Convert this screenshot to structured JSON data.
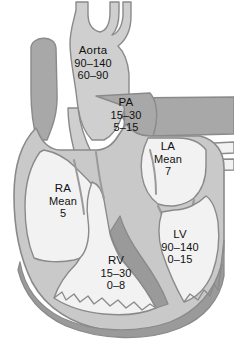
{
  "figure": {
    "units": "mmHg",
    "width": 234,
    "height": 346
  },
  "colors": {
    "background": "#ffffff",
    "chamber_lumen": "#f2f2f2",
    "myocardium": "#c9c9c9",
    "vessel_dark": "#a8a8a8",
    "apex_band": "#9a9a9a",
    "outline": "#8a8a8a",
    "text": "#111111"
  },
  "labels": {
    "aorta": {
      "name": "Aorta",
      "systolic": "90–140",
      "diastolic": "60–90"
    },
    "pa": {
      "name": "PA",
      "systolic": "15–30",
      "diastolic": "5–15"
    },
    "la": {
      "name": "LA",
      "measure": "Mean",
      "value": "7"
    },
    "ra": {
      "name": "RA",
      "measure": "Mean",
      "value": "5"
    },
    "lv": {
      "name": "LV",
      "systolic": "90–140",
      "diastolic": "0–15"
    },
    "rv": {
      "name": "RV",
      "systolic": "15–30",
      "diastolic": "0–8"
    }
  },
  "structures": [
    {
      "id": "svc",
      "label": "superior vena cava"
    },
    {
      "id": "aortic-arch",
      "label": "aortic arch with brachiocephalic branches"
    },
    {
      "id": "main-pulmonary-artery",
      "label": "main pulmonary artery"
    },
    {
      "id": "right-pulmonary-artery",
      "label": "right pulmonary artery"
    },
    {
      "id": "pulmonary-veins",
      "label": "pulmonary veins"
    },
    {
      "id": "right-atrium",
      "label": "right atrium"
    },
    {
      "id": "left-atrium",
      "label": "left atrium"
    },
    {
      "id": "right-ventricle",
      "label": "right ventricle"
    },
    {
      "id": "left-ventricle",
      "label": "left ventricle"
    },
    {
      "id": "interventricular-septum",
      "label": "interventricular septum"
    }
  ]
}
